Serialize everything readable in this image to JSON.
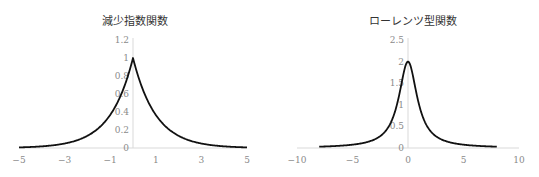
{
  "chart_data": [
    {
      "type": "line",
      "title": "減少指数関数",
      "function": "exp(-|x|)",
      "xlabel": "",
      "ylabel": "",
      "xlim": [
        -5,
        5
      ],
      "ylim": [
        0,
        1.2
      ],
      "x_ticks": [
        "−5",
        "−3",
        "−1",
        "1",
        "3",
        "5"
      ],
      "x_tick_values": [
        -5,
        -3,
        -1,
        1,
        3,
        5
      ],
      "y_ticks": [
        "0",
        "0.2",
        "0.4",
        "0.6",
        "0.8",
        "1",
        "1.2"
      ],
      "y_tick_values": [
        0,
        0.2,
        0.4,
        0.6,
        0.8,
        1,
        1.2
      ],
      "grid": false,
      "legend": "none",
      "x": [
        -5,
        -4,
        -3,
        -2,
        -1.5,
        -1,
        -0.5,
        0,
        0.5,
        1,
        1.5,
        2,
        3,
        4,
        5
      ],
      "values": [
        0.007,
        0.018,
        0.05,
        0.135,
        0.223,
        0.368,
        0.607,
        1.0,
        0.607,
        0.368,
        0.223,
        0.135,
        0.05,
        0.018,
        0.007
      ],
      "line_color": "#111111"
    },
    {
      "type": "line",
      "title": "ローレンツ型関数",
      "function": "2/(1+x^2)",
      "xlabel": "",
      "ylabel": "",
      "xlim": [
        -10,
        10
      ],
      "ylim": [
        0,
        2.5
      ],
      "x_ticks": [
        "−10",
        "−5",
        "0",
        "5",
        "10"
      ],
      "x_tick_values": [
        -10,
        -5,
        0,
        5,
        10
      ],
      "y_ticks": [
        "0",
        "0.5",
        "1",
        "1.5",
        "2",
        "2.5"
      ],
      "y_tick_values": [
        0,
        0.5,
        1,
        1.5,
        2,
        2.5
      ],
      "grid": false,
      "legend": "none",
      "x": [
        -8,
        -6,
        -4,
        -3,
        -2,
        -1.5,
        -1,
        -0.5,
        0,
        0.5,
        1,
        1.5,
        2,
        3,
        4,
        6,
        8
      ],
      "values": [
        0.031,
        0.054,
        0.118,
        0.2,
        0.4,
        0.615,
        1.0,
        1.6,
        2.0,
        1.6,
        1.0,
        0.615,
        0.4,
        0.2,
        0.118,
        0.054,
        0.031
      ],
      "line_color": "#111111"
    }
  ]
}
